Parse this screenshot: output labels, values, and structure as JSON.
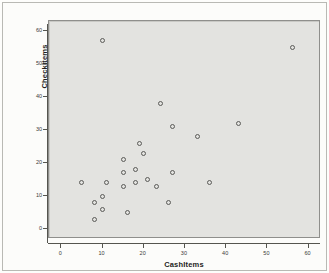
{
  "chart_data": {
    "type": "scatter",
    "title": "",
    "xlabel": "CashItems",
    "ylabel": "CheckItems",
    "xlim": [
      -3,
      63
    ],
    "ylim": [
      -3,
      63
    ],
    "xticks": [
      0,
      10,
      20,
      30,
      40,
      50,
      60
    ],
    "yticks": [
      0,
      10,
      20,
      30,
      40,
      50,
      60
    ],
    "xticklabels": [
      "0",
      "10",
      "20",
      "30",
      "40",
      "50",
      "60"
    ],
    "yticklabels": [
      "0",
      "10",
      "20",
      "30",
      "40",
      "50",
      "60"
    ],
    "grid": false,
    "legend": null,
    "marker": "open-circle",
    "marker_color": "#5b5b58",
    "plot_background": "#e3e3e0",
    "points": [
      {
        "x": 10,
        "y": 57
      },
      {
        "x": 56,
        "y": 55
      },
      {
        "x": 24,
        "y": 38
      },
      {
        "x": 43,
        "y": 32
      },
      {
        "x": 27,
        "y": 31
      },
      {
        "x": 33,
        "y": 28
      },
      {
        "x": 19,
        "y": 26
      },
      {
        "x": 20,
        "y": 23
      },
      {
        "x": 15,
        "y": 21
      },
      {
        "x": 18,
        "y": 18
      },
      {
        "x": 15,
        "y": 17
      },
      {
        "x": 27,
        "y": 17
      },
      {
        "x": 21,
        "y": 15
      },
      {
        "x": 5,
        "y": 14
      },
      {
        "x": 11,
        "y": 14
      },
      {
        "x": 18,
        "y": 14
      },
      {
        "x": 36,
        "y": 14
      },
      {
        "x": 23,
        "y": 13
      },
      {
        "x": 15,
        "y": 13
      },
      {
        "x": 10,
        "y": 10
      },
      {
        "x": 8,
        "y": 8
      },
      {
        "x": 26,
        "y": 8
      },
      {
        "x": 10,
        "y": 6
      },
      {
        "x": 16,
        "y": 5
      },
      {
        "x": 8,
        "y": 3
      }
    ]
  }
}
